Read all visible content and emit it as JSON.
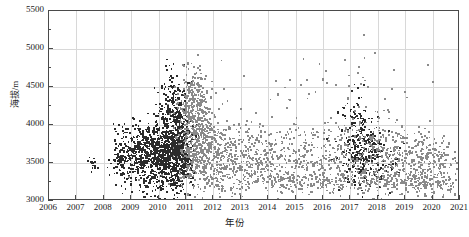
{
  "chart_data": {
    "type": "scatter",
    "title": "",
    "xlabel": "年份",
    "ylabel": "海拔/m",
    "xlim": [
      2006,
      2021
    ],
    "ylim": [
      3000,
      5500
    ],
    "grid": true,
    "legend": "none",
    "x_ticks": [
      "2006",
      "2007",
      "2008",
      "2009",
      "2010",
      "2011",
      "2012",
      "2013",
      "2014",
      "2015",
      "2016",
      "2017",
      "2018",
      "2019",
      "2020",
      "2021"
    ],
    "x_tick_values": [
      2006,
      2007,
      2008,
      2009,
      2010,
      2011,
      2012,
      2013,
      2014,
      2015,
      2016,
      2017,
      2018,
      2019,
      2020,
      2021
    ],
    "y_ticks": [
      "3000",
      "3500",
      "4000",
      "4500",
      "5000",
      "5500"
    ],
    "y_tick_values": [
      3000,
      3500,
      4000,
      4500,
      5000,
      5500
    ],
    "y_minor_ticks": [
      3250,
      3750,
      4250,
      4750,
      5250
    ],
    "colors": {
      "series_dark": "#2b2b2b",
      "series_gray": "#8a8a8a",
      "grid": "#d8d8d8",
      "axis": "#4a4a4a"
    },
    "series": [
      {
        "name": "早期观测(深色)",
        "color": "#2b2b2b",
        "marker": "square",
        "n_points": 1850,
        "x_range": [
          2007.4,
          2019.2
        ],
        "y_range": [
          3080,
          4700
        ],
        "clusters": [
          {
            "cx": 2007.6,
            "cy": 3490,
            "sx": 0.12,
            "sy": 70,
            "n": 14
          },
          {
            "cx": 2008.7,
            "cy": 3600,
            "sx": 0.22,
            "sy": 180,
            "n": 150
          },
          {
            "cx": 2009.5,
            "cy": 3620,
            "sx": 0.3,
            "sy": 190,
            "n": 330
          },
          {
            "cx": 2010.3,
            "cy": 3640,
            "sx": 0.33,
            "sy": 200,
            "n": 520
          },
          {
            "cx": 2010.8,
            "cy": 3680,
            "sx": 0.22,
            "sy": 230,
            "n": 380
          },
          {
            "cx": 2010.5,
            "cy": 4180,
            "sx": 0.3,
            "sy": 190,
            "n": 150
          },
          {
            "cx": 2010.6,
            "cy": 4480,
            "sx": 0.26,
            "sy": 130,
            "n": 40
          },
          {
            "cx": 2009.8,
            "cy": 3230,
            "sx": 0.55,
            "sy": 90,
            "n": 70
          },
          {
            "cx": 2017.4,
            "cy": 3620,
            "sx": 0.38,
            "sy": 230,
            "n": 230
          },
          {
            "cx": 2017.2,
            "cy": 4120,
            "sx": 0.28,
            "sy": 200,
            "n": 60
          },
          {
            "cx": 2018.3,
            "cy": 3560,
            "sx": 0.3,
            "sy": 180,
            "n": 40
          }
        ]
      },
      {
        "name": "后期观测(灰色)",
        "color": "#8a8a8a",
        "marker": "square",
        "n_points": 2400,
        "x_range": [
          2010.6,
          2021.0
        ],
        "y_range": [
          3080,
          5200
        ],
        "clusters": [
          {
            "cx": 2011.4,
            "cy": 3750,
            "sx": 0.35,
            "sy": 300,
            "n": 430
          },
          {
            "cx": 2011.3,
            "cy": 4300,
            "sx": 0.3,
            "sy": 230,
            "n": 200
          },
          {
            "cx": 2012.2,
            "cy": 3620,
            "sx": 0.45,
            "sy": 260,
            "n": 230
          },
          {
            "cx": 2013.3,
            "cy": 3560,
            "sx": 0.55,
            "sy": 230,
            "n": 180
          },
          {
            "cx": 2014.4,
            "cy": 3560,
            "sx": 0.6,
            "sy": 220,
            "n": 150
          },
          {
            "cx": 2015.6,
            "cy": 3580,
            "sx": 0.6,
            "sy": 220,
            "n": 110
          },
          {
            "cx": 2016.6,
            "cy": 3600,
            "sx": 0.55,
            "sy": 230,
            "n": 110
          },
          {
            "cx": 2018.0,
            "cy": 3600,
            "sx": 0.55,
            "sy": 250,
            "n": 200
          },
          {
            "cx": 2019.2,
            "cy": 3560,
            "sx": 0.55,
            "sy": 220,
            "n": 170
          },
          {
            "cx": 2020.2,
            "cy": 3520,
            "sx": 0.55,
            "sy": 200,
            "n": 150
          },
          {
            "cx": 2015.8,
            "cy": 3250,
            "sx": 2.6,
            "sy": 70,
            "n": 330
          },
          {
            "cx": 2019.6,
            "cy": 3250,
            "sx": 1.1,
            "sy": 70,
            "n": 110
          },
          {
            "cx": 2016.5,
            "cy": 4450,
            "sx": 1.8,
            "sy": 240,
            "n": 40
          }
        ],
        "outliers": [
          {
            "x": 2017.5,
            "y": 5180
          },
          {
            "x": 2017.9,
            "y": 4950
          },
          {
            "x": 2016.8,
            "y": 4860
          },
          {
            "x": 2010.9,
            "y": 4790
          },
          {
            "x": 2017.3,
            "y": 4760
          },
          {
            "x": 2018.6,
            "y": 4720
          },
          {
            "x": 2013.1,
            "y": 4640
          },
          {
            "x": 2011.7,
            "y": 4610
          },
          {
            "x": 2020.0,
            "y": 4560
          },
          {
            "x": 2015.2,
            "y": 4520
          },
          {
            "x": 2012.4,
            "y": 4480
          },
          {
            "x": 2019.0,
            "y": 4440
          }
        ]
      }
    ]
  }
}
